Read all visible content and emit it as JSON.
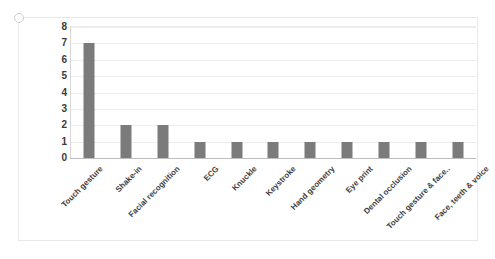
{
  "chart_data": {
    "type": "bar",
    "title": "",
    "subtitle": "",
    "xlabel": "",
    "ylabel": "",
    "ylim": [
      0,
      8
    ],
    "yticks": [
      0,
      1,
      2,
      3,
      4,
      5,
      6,
      7,
      8
    ],
    "grid": true,
    "legend": false,
    "legend_position": "none",
    "orientation": "vertical",
    "categories": [
      "Touch gesture",
      "Shake-in",
      "Facial recognition",
      "ECG",
      "Knuckle",
      "Keystroke",
      "Hand geometry",
      "Eye print",
      "Dental occlusion",
      "Touch gesture & face..",
      "Face, teeth & voice"
    ],
    "values": [
      7,
      2,
      2,
      1,
      1,
      1,
      1,
      1,
      1,
      1,
      1
    ],
    "series": [
      {
        "name": "Series 1",
        "values": [
          7,
          2,
          2,
          1,
          1,
          1,
          1,
          1,
          1,
          1,
          1
        ],
        "color": "#7b7b7b"
      }
    ],
    "label_rotation_deg": -45
  },
  "style": {
    "bar_color": "#7b7b7b",
    "gridline_color": "#ededed",
    "axis_color": "#bcbcbc",
    "tick_text_color": "#3a3a3a",
    "category_text_color": "#3d3d3d",
    "chart_border_color": "#e9e9e9",
    "background": "#ffffff"
  }
}
